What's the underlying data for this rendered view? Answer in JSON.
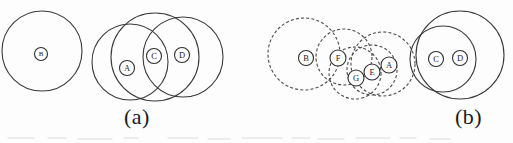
{
  "figure": {
    "background_color": "#fdfdfd",
    "stroke_color": "#3a3a3a",
    "label_color": "#1c1c1c",
    "panels": [
      {
        "id": "a",
        "caption": "(a)",
        "caption_x": 124,
        "caption_y": 104,
        "big_circles": [
          {
            "name": "circle-b-outer",
            "style": "solid",
            "cx": 42,
            "cy": 51,
            "r": 40
          },
          {
            "name": "circle-a-outer",
            "style": "solid",
            "cx": 130,
            "cy": 62,
            "r": 38
          },
          {
            "name": "circle-c-outer",
            "style": "solid",
            "cx": 155,
            "cy": 57,
            "r": 44
          },
          {
            "name": "circle-d-outer",
            "style": "solid",
            "cx": 183,
            "cy": 57,
            "r": 40
          }
        ],
        "nodes": [
          {
            "label": "B",
            "cx": 41,
            "cy": 54,
            "r": 6.5
          },
          {
            "label": "A",
            "cx": 127,
            "cy": 68,
            "r": 7.5
          },
          {
            "label": "C",
            "cx": 154,
            "cy": 56,
            "r": 7.5
          },
          {
            "label": "D",
            "cx": 182,
            "cy": 55,
            "r": 7.5
          }
        ]
      },
      {
        "id": "b",
        "caption": "(b)",
        "caption_x": 455,
        "caption_y": 104,
        "big_circles": [
          {
            "name": "circle-b-outer",
            "style": "dashed",
            "cx": 304,
            "cy": 54,
            "r": 36
          },
          {
            "name": "circle-f-outer",
            "style": "dashed",
            "cx": 344,
            "cy": 57,
            "r": 28
          },
          {
            "name": "circle-g-outer",
            "style": "dashed",
            "cx": 355,
            "cy": 73,
            "r": 26
          },
          {
            "name": "circle-e-outer",
            "style": "dashed",
            "cx": 372,
            "cy": 70,
            "r": 25
          },
          {
            "name": "circle-a-outer",
            "style": "dashed",
            "cx": 383,
            "cy": 64,
            "r": 32
          },
          {
            "name": "circle-c-outer",
            "style": "solid",
            "cx": 443,
            "cy": 59,
            "r": 33
          },
          {
            "name": "circle-d-outer",
            "style": "solid",
            "cx": 460,
            "cy": 55,
            "r": 44
          }
        ],
        "nodes": [
          {
            "label": "B",
            "cx": 306,
            "cy": 58,
            "r": 7.5
          },
          {
            "label": "F",
            "cx": 338,
            "cy": 58,
            "r": 8.0
          },
          {
            "label": "G",
            "cx": 356,
            "cy": 78,
            "r": 8.0
          },
          {
            "label": "E",
            "cx": 372,
            "cy": 72,
            "r": 8.0
          },
          {
            "label": "A",
            "cx": 389,
            "cy": 65,
            "r": 8.0
          },
          {
            "label": "C",
            "cx": 436,
            "cy": 59,
            "r": 7.5
          },
          {
            "label": "D",
            "cx": 460,
            "cy": 58,
            "r": 7.5
          }
        ]
      }
    ]
  }
}
